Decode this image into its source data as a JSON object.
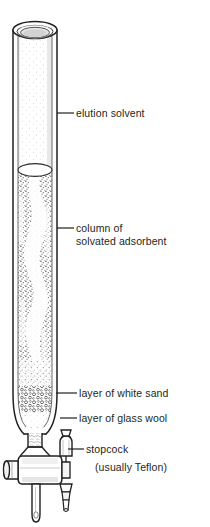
{
  "figure": {
    "background_color": "#ffffff",
    "ink_color": "#231f20"
  },
  "labels": {
    "elution_solvent": "elution solvent",
    "column_of": "column of",
    "solvated_adsorbent": "solvated adsorbent",
    "white_sand": "layer of white sand",
    "glass_wool": "layer of glass wool",
    "stopcock": "stopcock",
    "teflon_note": "(usually Teflon)"
  },
  "parts": [
    {
      "name": "ground-glass-rim",
      "description": "open top rim of column"
    },
    {
      "name": "elution-solvent-region",
      "description": "clear liquid above adsorbent bed"
    },
    {
      "name": "solvent-meniscus",
      "description": "white ellipse at top of packing"
    },
    {
      "name": "adsorbent-bed",
      "description": "stippled solvated adsorbent packing"
    },
    {
      "name": "white-sand-layer",
      "description": "coarse granular layer near bottom"
    },
    {
      "name": "glass-wool-plug",
      "description": "plug in neck below column"
    },
    {
      "name": "stopcock-body",
      "description": "horizontal teflon stopcock barrel"
    },
    {
      "name": "stopcock-handle",
      "description": "knob on left side of stopcock"
    },
    {
      "name": "stopcock-plug",
      "description": "tapered stepped plug on right side"
    },
    {
      "name": "drip-tip",
      "description": "vertical outlet tube below stopcock"
    }
  ]
}
